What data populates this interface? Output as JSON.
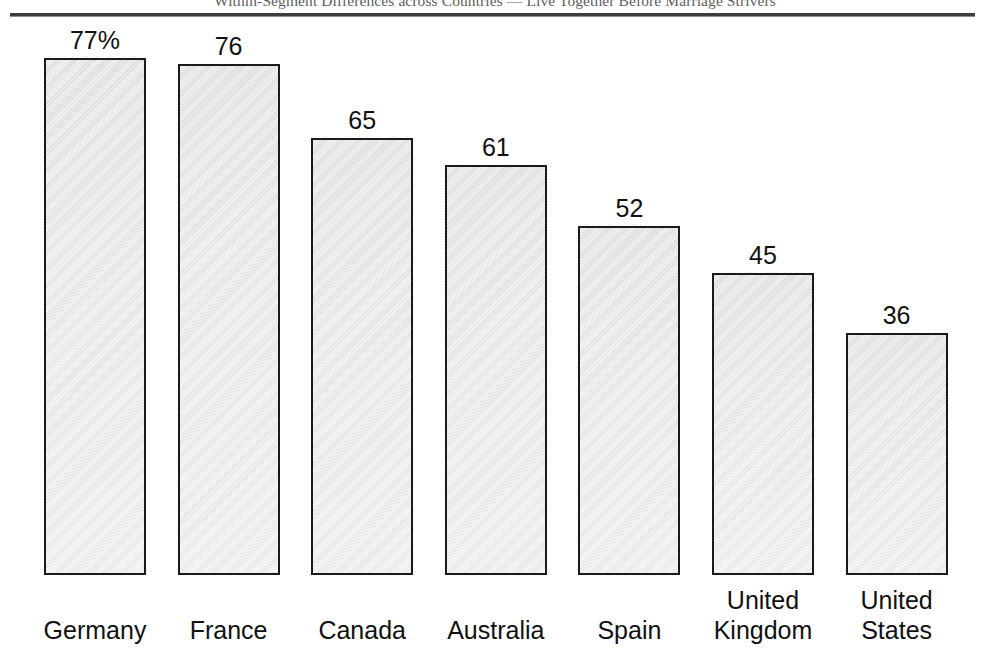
{
  "header": {
    "running_title": "Within-Segment Differences across Countries — Live Together Before Marriage Strivers"
  },
  "chart_data": {
    "type": "bar",
    "title": "Within-Segment Differences across Countries — Live Together Before Marriage Strivers",
    "xlabel": "",
    "ylabel": "",
    "ylim": [
      0,
      86
    ],
    "grid": false,
    "legend": null,
    "unit": "%",
    "categories": [
      "Germany",
      "France",
      "Canada",
      "Australia",
      "Spain",
      "United Kingdom",
      "United States"
    ],
    "values": [
      77,
      76,
      65,
      61,
      52,
      45,
      36
    ],
    "value_labels": [
      "77%",
      "76",
      "65",
      "61",
      "52",
      "45",
      "36"
    ],
    "bar_style": {
      "fill": "#e9e9e9",
      "edge": "#1a1a1a",
      "edge_width_px": 2
    }
  }
}
